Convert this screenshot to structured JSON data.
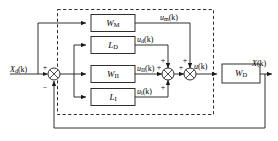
{
  "diagram": {
    "type": "block-diagram",
    "line_color": "#1a1a1a",
    "background": "#ffffff",
    "inputs": [
      {
        "name": "reference-input",
        "base": "X",
        "sub": "d",
        "arg": "(k)",
        "full": "Xd(k)"
      }
    ],
    "outputs": [
      {
        "name": "plant-output",
        "base": "X",
        "sub": "",
        "arg": "(k)",
        "full": "X(k)"
      }
    ],
    "blocks": [
      {
        "id": "w-m",
        "base": "W",
        "sub": "M",
        "full": "WM"
      },
      {
        "id": "l-d",
        "base": "L",
        "sub": "D",
        "full": "LD"
      },
      {
        "id": "w-ii",
        "base": "W",
        "sub": "II",
        "full": "WII"
      },
      {
        "id": "l-i",
        "base": "L",
        "sub": "I",
        "full": "LI"
      },
      {
        "id": "w-d",
        "base": "W",
        "sub": "D",
        "full": "WD"
      }
    ],
    "signals": [
      {
        "id": "u-m",
        "base": "u",
        "sub": "m",
        "arg": "(k)",
        "full": "um(k)"
      },
      {
        "id": "u-d",
        "base": "u",
        "sub": "d",
        "arg": "(k)",
        "full": "ud(k)"
      },
      {
        "id": "u-ii",
        "base": "u",
        "sub": "II",
        "arg": "(k)",
        "full": "uII(k)"
      },
      {
        "id": "u-i",
        "base": "u",
        "sub": "i",
        "arg": "(k)",
        "full": "ui(k)"
      },
      {
        "id": "u",
        "base": "u",
        "sub": "",
        "arg": "(k)",
        "full": "u(k)"
      }
    ],
    "signs": {
      "input_plus": "+",
      "feedback_minus": "−",
      "sum1_top": "+",
      "sum1_left": "+",
      "sum1_bottom": "+",
      "sum2_top": "+",
      "sum2_left": "+"
    },
    "summing_junctions": [
      {
        "id": "error-sum",
        "name": "error-summing-junction"
      },
      {
        "id": "inner-sum",
        "name": "inner-summing-junction"
      },
      {
        "id": "outer-sum",
        "name": "outer-summing-junction"
      }
    ],
    "enclosure": {
      "id": "controller-boundary",
      "style": "dashed"
    }
  }
}
